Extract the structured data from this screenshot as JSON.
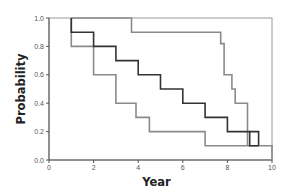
{
  "chart_data": {
    "type": "line",
    "subtype": "step (Kaplan-Meier style survival curves)",
    "title": "",
    "xlabel": "Year",
    "ylabel": "Probability",
    "xlim": [
      0,
      10
    ],
    "ylim": [
      0,
      1.0
    ],
    "x_ticks": [
      0,
      2,
      4,
      6,
      8,
      10
    ],
    "y_ticks": [
      0.0,
      0.2,
      0.4,
      0.6,
      0.8,
      1.0
    ],
    "y_tick_labels": [
      "0.0",
      "0.2",
      "0.4",
      "0.6",
      "0.8",
      "1.0"
    ],
    "x_tick_labels": [
      "0",
      "2",
      "4",
      "6",
      "8",
      "10"
    ],
    "grid": false,
    "legend": null,
    "series": [
      {
        "name": "curve-upper-gray",
        "color": "#8a8a8a",
        "x": [
          1.0,
          3.7,
          3.7,
          7.7,
          7.7,
          7.85,
          7.85,
          8.2,
          8.2,
          8.35,
          8.35,
          8.9,
          8.9
        ],
        "y": [
          1.0,
          1.0,
          0.9,
          0.9,
          0.82,
          0.82,
          0.6,
          0.6,
          0.5,
          0.5,
          0.4,
          0.4,
          0.1
        ]
      },
      {
        "name": "curve-middle-black",
        "color": "#333333",
        "x": [
          1.0,
          1.0,
          2.0,
          2.0,
          3.0,
          3.0,
          4.0,
          4.0,
          5.0,
          5.0,
          6.0,
          6.0,
          7.0,
          7.0,
          8.0,
          8.0,
          9.0,
          9.0,
          9.4,
          9.4
        ],
        "y": [
          1.0,
          0.9,
          0.9,
          0.8,
          0.8,
          0.7,
          0.7,
          0.6,
          0.6,
          0.5,
          0.5,
          0.4,
          0.4,
          0.3,
          0.3,
          0.2,
          0.2,
          0.1,
          0.1,
          0.1
        ]
      },
      {
        "name": "curve-lower-gray",
        "color": "#8a8a8a",
        "x": [
          1.0,
          1.0,
          2.0,
          2.0,
          3.0,
          3.0,
          3.9,
          3.9,
          4.5,
          4.5,
          7.0,
          7.0,
          10.0,
          10.0
        ],
        "y": [
          1.0,
          0.8,
          0.8,
          0.6,
          0.6,
          0.4,
          0.4,
          0.3,
          0.3,
          0.2,
          0.2,
          0.1,
          0.1,
          0.0
        ]
      }
    ],
    "extra_segments": [
      {
        "series": "curve-middle-black",
        "x": [
          9.0,
          9.4,
          9.4
        ],
        "y": [
          0.2,
          0.2,
          0.1
        ]
      }
    ]
  },
  "plot": {
    "frame_color": "#9a9a9a",
    "axis_color": "#555555",
    "pixel_box": {
      "x0": 49,
      "x1": 272,
      "y_top": 18,
      "y_bottom": 160
    }
  }
}
